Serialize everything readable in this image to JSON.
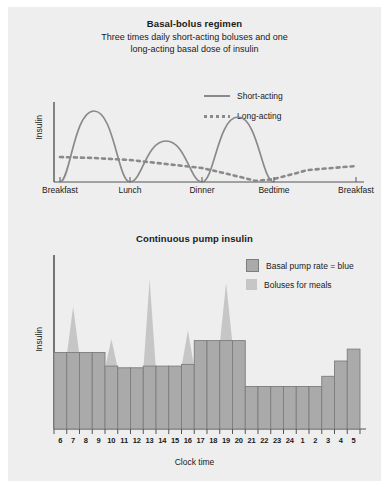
{
  "figure": {
    "background": "#eeeeee",
    "basal_color": "#aaaaaa",
    "bolus_color": "#c6c6c6",
    "curve_color": "#8a8a8a"
  },
  "top": {
    "title": "Basal-bolus regimen",
    "subtitle_line1": "Three times daily short-acting boluses and one",
    "subtitle_line2": "long-acting basal dose of insulin",
    "ylabel": "Insulin",
    "legend": [
      {
        "label": "Short-acting",
        "style": "solid",
        "icon": "solid-line-swatch"
      },
      {
        "label": "Long-acting",
        "style": "dotted",
        "icon": "dotted-line-swatch"
      }
    ],
    "xticks": [
      "Breakfast",
      "Lunch",
      "Dinner",
      "Bedtime",
      "Breakfast"
    ]
  },
  "bottom": {
    "title": "Continuous pump insulin",
    "ylabel": "Insulin",
    "xlabel": "Clock time",
    "legend": [
      {
        "label": "Basal pump rate = blue",
        "icon": "basal-bar-swatch"
      },
      {
        "label": "Boluses for meals",
        "icon": "bolus-spike-swatch"
      }
    ]
  },
  "chart_data": [
    {
      "type": "line",
      "title": "Basal-bolus regimen",
      "subtitle": "Three times daily short-acting boluses and one long-acting basal dose of insulin",
      "xlabel": "",
      "ylabel": "Insulin",
      "grid": false,
      "legend_position": "top-right",
      "xtick_labels": [
        "Breakfast",
        "Lunch",
        "Dinner",
        "Bedtime",
        "Breakfast"
      ],
      "xtick_positions": [
        0,
        25,
        50,
        70,
        100
      ],
      "xlim": [
        0,
        100
      ],
      "ylim": [
        0,
        100
      ],
      "series": [
        {
          "name": "Short-acting",
          "style": "solid",
          "note": "Three bell-shaped bolus peaks following breakfast, lunch and dinner",
          "peaks": [
            {
              "meal": "Breakfast",
              "x": 13,
              "peak_height": 88,
              "start_x": 2,
              "end_x": 25
            },
            {
              "meal": "Lunch",
              "x": 37,
              "peak_height": 50,
              "start_x": 25,
              "end_x": 50
            },
            {
              "meal": "Dinner",
              "x": 62,
              "peak_height": 80,
              "start_x": 50,
              "end_x": 72
            }
          ]
        },
        {
          "name": "Long-acting",
          "style": "dotted",
          "note": "Slowly declining basal level from breakfast to a trough at bedtime, then rising again",
          "x": [
            2,
            12,
            25,
            37,
            50,
            60,
            70,
            75,
            85,
            97
          ],
          "y": [
            31,
            30,
            28,
            24,
            20,
            14,
            4,
            7,
            17,
            23
          ]
        }
      ]
    },
    {
      "type": "bar",
      "title": "Continuous pump insulin",
      "xlabel": "Clock time",
      "ylabel": "Insulin",
      "grid": false,
      "legend_position": "top-right",
      "ylim": [
        0,
        100
      ],
      "categories": [
        "6",
        "7",
        "8",
        "9",
        "10",
        "11",
        "12",
        "13",
        "14",
        "15",
        "16",
        "17",
        "18",
        "19",
        "20",
        "21",
        "22",
        "23",
        "24",
        "1",
        "2",
        "3",
        "4",
        "5"
      ],
      "series": [
        {
          "name": "Basal pump rate",
          "values": [
            45,
            45,
            45,
            45,
            37,
            36,
            36,
            37,
            37,
            37,
            38,
            52,
            52,
            52,
            52,
            25,
            25,
            25,
            25,
            25,
            25,
            31,
            40,
            47
          ]
        },
        {
          "name": "Boluses for meals",
          "note": "Triangular bolus spikes drawn above the basal bar at meal hours; value is spike apex height",
          "values": [
            0,
            72,
            0,
            0,
            53,
            0,
            0,
            88,
            0,
            0,
            58,
            0,
            0,
            86,
            0,
            0,
            0,
            0,
            0,
            0,
            0,
            0,
            0,
            0
          ]
        }
      ]
    }
  ]
}
